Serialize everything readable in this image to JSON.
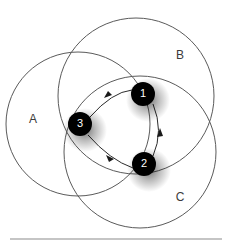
{
  "figure": {
    "kind": "venn-diagram-with-directed-cycle",
    "width": 231,
    "height": 244,
    "background_color": "#ffffff",
    "stroke_color": "#5a5a5a",
    "edge_color": "#2b2b2b",
    "node_fill_color": "#000000",
    "node_text_color": "#ffffff",
    "rule_color": "#b2b2b2"
  },
  "sets": [
    {
      "id": "A",
      "label": "A",
      "cx": 78,
      "cy": 124,
      "r": 72,
      "label_x": 33,
      "label_y": 120
    },
    {
      "id": "B",
      "label": "B",
      "cx": 136,
      "cy": 96,
      "r": 78,
      "label_x": 180,
      "label_y": 56
    },
    {
      "id": "C",
      "label": "C",
      "cx": 140,
      "cy": 152,
      "r": 76,
      "label_x": 180,
      "label_y": 198
    }
  ],
  "nodes": [
    {
      "id": "n1",
      "label": "1",
      "x": 143,
      "y": 94,
      "r": 12
    },
    {
      "id": "n2",
      "label": "2",
      "x": 144,
      "y": 164,
      "r": 12
    },
    {
      "id": "n3",
      "label": "3",
      "x": 80,
      "y": 124,
      "r": 12
    }
  ],
  "edges": [
    {
      "id": "e1",
      "from": "3",
      "to": "1",
      "arrow_at": "1",
      "style": "curved"
    },
    {
      "id": "e2",
      "from": "1",
      "to": "2",
      "arrow_at": "2",
      "style": "curved"
    },
    {
      "id": "e3",
      "from": "2",
      "to": "3",
      "arrow_at": "3",
      "style": "curved"
    }
  ],
  "baseline": {
    "x1": 10,
    "x2": 222,
    "y": 239
  }
}
